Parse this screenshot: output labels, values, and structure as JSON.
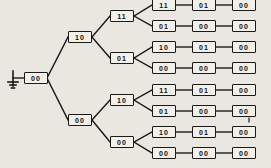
{
  "diagram": {
    "background_color": "#e9e7e0",
    "line_color": "#1a1a1a",
    "box_fill": "#f2f0ea",
    "ground_symbol": "ground-icon",
    "root": {
      "label": "00"
    },
    "level2": [
      {
        "label": "10"
      },
      {
        "label": "00"
      }
    ],
    "level3": [
      {
        "label": "11"
      },
      {
        "label": "01"
      },
      {
        "label": "10"
      },
      {
        "label": "00"
      }
    ],
    "rows": [
      {
        "cells": [
          "11",
          "01",
          "00"
        ]
      },
      {
        "cells": [
          "01",
          "00",
          "00"
        ]
      },
      {
        "cells": [
          "10",
          "01",
          "00"
        ]
      },
      {
        "cells": [
          "00",
          "00",
          "00"
        ]
      },
      {
        "cells": [
          "11",
          "01",
          "00"
        ]
      },
      {
        "cells": [
          "01",
          "00",
          "00"
        ]
      },
      {
        "cells": [
          "10",
          "01",
          "00"
        ]
      },
      {
        "cells": [
          "00",
          "00",
          "00"
        ]
      }
    ]
  }
}
